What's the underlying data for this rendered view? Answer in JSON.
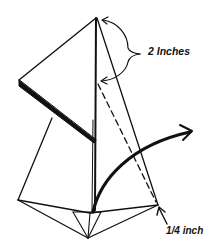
{
  "diagram": {
    "type": "paper-folding-instruction",
    "labels": {
      "top_measure": "2 Inches",
      "bottom_measure": "1/4 inch"
    },
    "colors": {
      "ink": "#111111",
      "background": "#ffffff"
    },
    "elements": [
      "kite-shaped folded paper with apex at top",
      "left flap folded outward",
      "center crease line",
      "dashed fold line",
      "curved arrow indicating fold direction",
      "bottom triangular point with creases"
    ]
  }
}
